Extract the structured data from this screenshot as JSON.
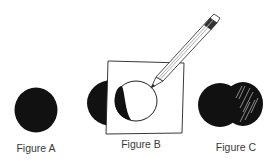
{
  "figures": [
    {
      "id": "A",
      "label": "Figure A",
      "description": "solid black circle"
    },
    {
      "id": "B",
      "label": "Figure B",
      "description": "black circle partially covered by a square sheet of paper; a pencil traces the circle outline on the paper, with the shadowed black crescent visible through it"
    },
    {
      "id": "C",
      "label": "Figure C",
      "description": "two overlapping black circles; the right one shaded with white hatch strokes"
    }
  ],
  "colors": {
    "ink": "#111111",
    "paper": "#ffffff",
    "label": "#3a3a3a"
  }
}
